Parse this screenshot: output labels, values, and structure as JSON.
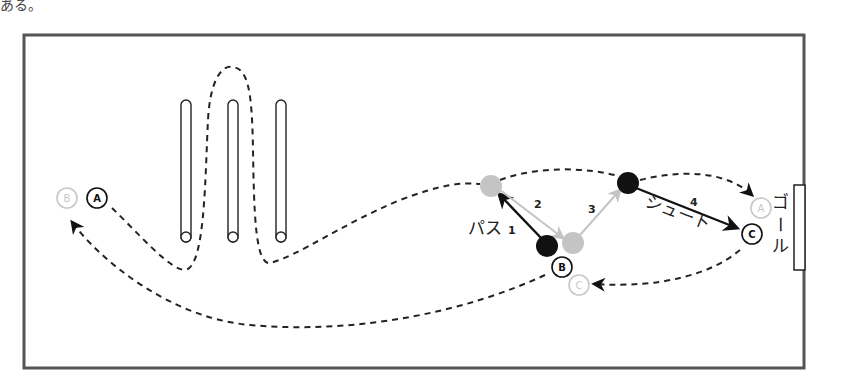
{
  "page_fragment": "ある。",
  "diagram": {
    "players": {
      "A_start": "A",
      "B_ghost": "B",
      "B": "B",
      "C": "C",
      "C_ghost": "C",
      "A_ghost": "A"
    },
    "labels": {
      "pass": "パス",
      "pass_num": "1",
      "step2": "2",
      "step3": "3",
      "step4": "4",
      "shoot": "シュート",
      "goal_1": "ゴ",
      "goal_2": "ー",
      "goal_3": "ル"
    },
    "colors": {
      "frame": "#555555",
      "ink": "#111111",
      "ghost": "#c8c8c8",
      "ball_grey": "#c4c4c4"
    }
  }
}
